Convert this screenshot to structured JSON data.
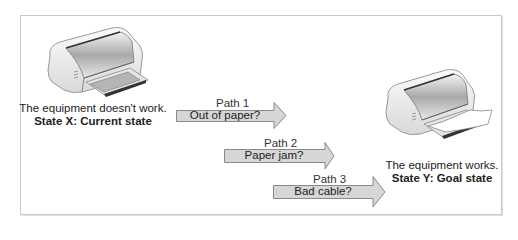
{
  "diagram": {
    "type": "problem-solving paths",
    "start": {
      "description": "The equipment doesn't work.",
      "state_label": "State X: Current state",
      "icon": "printer-icon"
    },
    "goal": {
      "description": "The equipment works.",
      "state_label": "State Y: Goal state",
      "icon": "printer-with-paper-icon"
    },
    "paths": [
      {
        "name": "Path 1",
        "hypothesis": "Out of paper?"
      },
      {
        "name": "Path 2",
        "hypothesis": "Paper jam?"
      },
      {
        "name": "Path 3",
        "hypothesis": "Bad cable?"
      }
    ],
    "colors": {
      "arrow_fill": "#d6d6d6",
      "arrow_stroke": "#8a8a8a",
      "frame_border": "#c9c9c9"
    }
  }
}
